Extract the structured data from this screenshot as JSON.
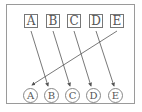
{
  "top_labels": [
    "A",
    "B",
    "C",
    "D",
    "E"
  ],
  "bottom_labels": [
    "A",
    "B",
    "C",
    "D",
    "E"
  ],
  "connections": [
    {
      "from": "A",
      "to": "B"
    },
    {
      "from": "B",
      "to": "C"
    },
    {
      "from": "C",
      "to": "D"
    },
    {
      "from": "D",
      "to": "E"
    },
    {
      "from": "E",
      "to": "A"
    }
  ],
  "colors": {
    "line": "#555555",
    "border": "#9a9a9a"
  }
}
